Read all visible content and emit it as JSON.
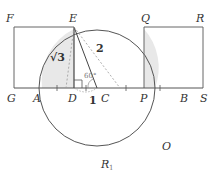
{
  "diagram": {
    "type": "geometry-construction",
    "points": {
      "F": "F",
      "E": "E",
      "Q": "Q",
      "R": "R",
      "G": "G",
      "A": "A",
      "D": "D",
      "C": "C",
      "P": "P",
      "B": "B",
      "S": "S",
      "O": "O",
      "R1": "R",
      "R1_sub": "1"
    },
    "measures": {
      "ED": "√3",
      "EC": "2",
      "DC": "1",
      "angle": "60°"
    },
    "colors": {
      "stroke": "#555555",
      "shade": "#e6e6e6",
      "dashed": "#888888"
    }
  }
}
